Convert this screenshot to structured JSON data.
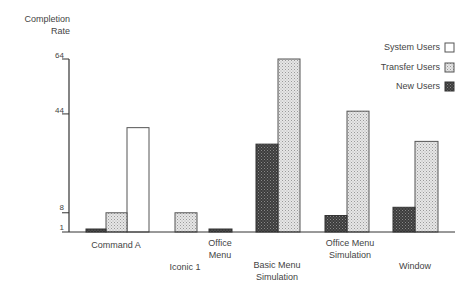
{
  "chart_data": {
    "type": "bar",
    "title": "",
    "xlabel": "",
    "ylabel": "Completion Rate",
    "ylabel_lines": [
      "Completion",
      "Rate"
    ],
    "yticks": [
      1,
      8,
      44,
      64
    ],
    "ylim": [
      1,
      64
    ],
    "grid": false,
    "legend_position": "upper right",
    "categories": [
      "Command A",
      "Iconic 1",
      "Office Menu",
      "Basic Menu Simulation",
      "Office Menu Simulation",
      "Window"
    ],
    "category_lines": [
      [
        "Command A"
      ],
      [
        "Iconic 1"
      ],
      [
        "Office",
        "Menu"
      ],
      [
        "Basic Menu",
        "Simulation"
      ],
      [
        "Office Menu",
        "Simulation"
      ],
      [
        "Window"
      ]
    ],
    "series": [
      {
        "name": "System Users",
        "fill": "white",
        "values": [
          39,
          null,
          null,
          null,
          null,
          null
        ]
      },
      {
        "name": "Transfer Users",
        "fill": "light-stipple",
        "values": [
          8,
          8,
          null,
          64,
          45,
          34
        ]
      },
      {
        "name": "New Users",
        "fill": "dark-stipple",
        "values": [
          1,
          null,
          2,
          33,
          7,
          10
        ]
      }
    ]
  },
  "legend": [
    {
      "label": "System Users",
      "swatch": "white"
    },
    {
      "label": "Transfer Users",
      "swatch": "light"
    },
    {
      "label": "New Users",
      "swatch": "dark"
    }
  ],
  "colors": {
    "axis": "#333333",
    "light_fill": "#d6d6d6",
    "dark_fill": "#4a4a4a",
    "outline": "#555555"
  }
}
